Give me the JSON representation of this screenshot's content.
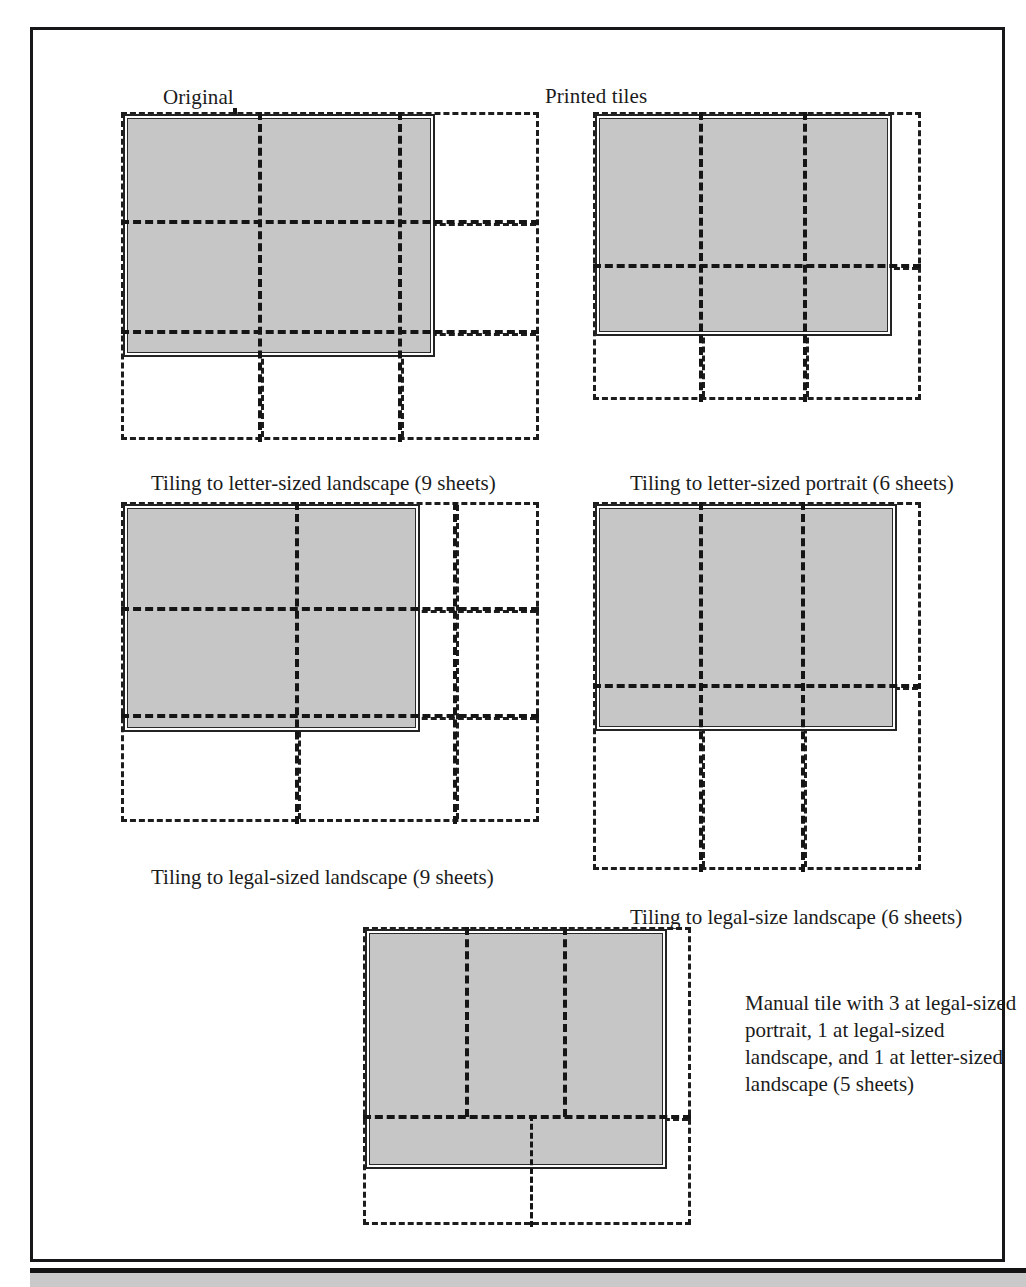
{
  "figure": {
    "labels": {
      "original": "Original",
      "printed_tiles": "Printed tiles"
    },
    "captions": {
      "letter_landscape_9": "Tiling to letter-sized landscape (9 sheets)",
      "letter_portrait_6": "Tiling to letter-sized portrait (6 sheets)",
      "legal_landscape_9": "Tiling to legal-sized landscape (9 sheets)",
      "legal_landscape_6": "Tiling to legal-size landscape (6 sheets)",
      "manual_tile_5": "Manual tile with 3 at legal-sized portrait, 1 at legal-sized landscape, and 1 at letter-sized landscape (5 sheets)"
    },
    "colors": {
      "document_fill": "#c6c6c6",
      "line": "#1d1d1d",
      "frame": "#17171a",
      "footer_band": "#c9c9c9"
    },
    "footer": {
      "text": ""
    },
    "diagrams": [
      {
        "id": "letter-landscape-9",
        "sheet_size": "letter",
        "orientation": "landscape",
        "sheets": 9,
        "grid_columns": 3,
        "grid_rows": 3,
        "caption": "Tiling to letter-sized landscape (9 sheets)"
      },
      {
        "id": "letter-portrait-6",
        "sheet_size": "letter",
        "orientation": "portrait",
        "sheets": 6,
        "grid_columns": 3,
        "grid_rows": 2,
        "caption": "Tiling to letter-sized portrait (6 sheets)"
      },
      {
        "id": "legal-landscape-9",
        "sheet_size": "legal",
        "orientation": "landscape",
        "sheets": 9,
        "grid_columns": 3,
        "grid_rows": 3,
        "caption": "Tiling to legal-sized landscape (9 sheets)"
      },
      {
        "id": "legal-landscape-6",
        "sheet_size": "legal",
        "orientation": "landscape",
        "sheets": 6,
        "grid_columns": 3,
        "grid_rows": 2,
        "caption": "Tiling to legal-size landscape (6 sheets)"
      },
      {
        "id": "manual-tile-5",
        "sheet_size": "mixed",
        "orientation": "mixed",
        "sheets": 5,
        "grid_columns": 3,
        "grid_rows": 2,
        "caption": "Manual tile with 3 at legal-sized portrait, 1 at legal-sized landscape, and 1 at letter-sized landscape (5 sheets)"
      }
    ]
  }
}
